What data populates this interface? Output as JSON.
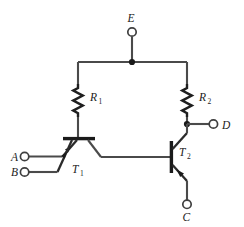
{
  "figure": {
    "name": "ttl-logic-gate-schematic",
    "background_color": "#ffffff",
    "wire_color": "#4a4a4a",
    "ink_color": "#1a1a1a",
    "width": 244,
    "height": 227
  },
  "terminals": {
    "e": {
      "label": "E",
      "role": "supply-top"
    },
    "a": {
      "label": "A",
      "role": "input-upper-left"
    },
    "b": {
      "label": "B",
      "role": "input-lower-left"
    },
    "c": {
      "label": "C",
      "role": "output-bottom"
    },
    "d": {
      "label": "D",
      "role": "output-right"
    }
  },
  "resistors": {
    "r1": {
      "label": "R",
      "sub": "1"
    },
    "r2": {
      "label": "R",
      "sub": "2"
    }
  },
  "transistors": {
    "t1": {
      "label": "T",
      "sub": "1",
      "type": "multi-emitter-npn"
    },
    "t2": {
      "label": "T",
      "sub": "2",
      "type": "npn"
    }
  },
  "junctions": [
    {
      "name": "supply-rail-node",
      "x": 132,
      "y": 62
    },
    {
      "name": "r2-output-node",
      "x": 187,
      "y": 124
    }
  ]
}
